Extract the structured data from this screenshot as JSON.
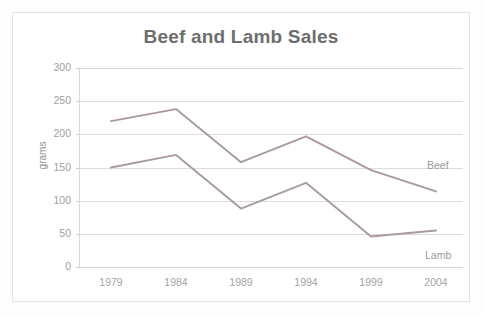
{
  "figure": {
    "title": "Beef and Lamb Sales",
    "y_axis_title": "grams",
    "series_labels": {
      "beef": "Beef",
      "lamb": "Lamb"
    },
    "colors": {
      "beef_line": "#a89a9e",
      "lamb_line": "#a89a9e",
      "gridline": "#dcdcdc",
      "text": "#9a9a9a",
      "title_text": "#6e6e6e",
      "frame": "#e2e2e2",
      "background": "#ffffff"
    }
  },
  "chart_data": {
    "type": "line",
    "title": "Beef and Lamb Sales",
    "xlabel": "",
    "ylabel": "grams",
    "categories": [
      "1979",
      "1984",
      "1989",
      "1994",
      "1999",
      "2004"
    ],
    "ylim": [
      0,
      300
    ],
    "yticks": [
      "0",
      "50",
      "100",
      "150",
      "200",
      "250",
      "300"
    ],
    "ytick_values": [
      0,
      50,
      100,
      150,
      200,
      250,
      300
    ],
    "grid": true,
    "legend_position": "inline-right-of-series",
    "series": [
      {
        "name": "Beef",
        "values": [
          220,
          238,
          158,
          197,
          146,
          114
        ]
      },
      {
        "name": "Lamb",
        "values": [
          150,
          169,
          88,
          127,
          46,
          55
        ]
      }
    ]
  }
}
